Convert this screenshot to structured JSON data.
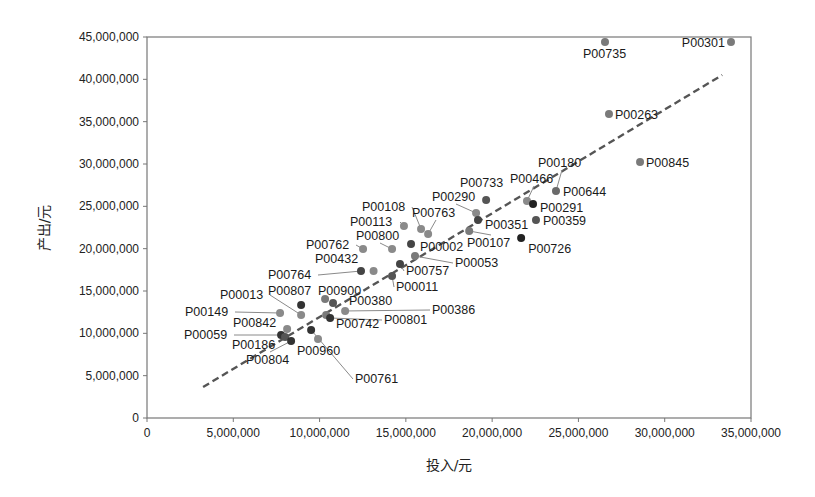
{
  "chart_data": {
    "type": "scatter",
    "title": "",
    "xlabel": "投入/元",
    "ylabel": "产出/元",
    "xlim": [
      0,
      35000000
    ],
    "ylim": [
      0,
      45000000
    ],
    "x_ticks": [
      0,
      5000000,
      10000000,
      15000000,
      20000000,
      25000000,
      30000000,
      35000000
    ],
    "x_tick_labels": [
      "0",
      "5,000,000",
      "10,000,000",
      "15,000,000",
      "20,000,000",
      "25,000,000",
      "30,000,000",
      "35,000,000"
    ],
    "y_ticks": [
      0,
      5000000,
      10000000,
      15000000,
      20000000,
      25000000,
      30000000,
      35000000,
      40000000,
      45000000
    ],
    "y_tick_labels": [
      "0",
      "5,000,000",
      "10,000,000",
      "15,000,000",
      "20,000,000",
      "25,000,000",
      "30,000,000",
      "35,000,000",
      "40,000,000",
      "45,000,000"
    ],
    "grid": false,
    "legend": false,
    "trendline": {
      "style": "dashed",
      "color": "#555555",
      "start": [
        3250000,
        3660000
      ],
      "end": [
        33330000,
        40510000
      ]
    },
    "points": [
      {
        "id": "P00735",
        "x": 26540000,
        "y": 44410000,
        "color": "#7a7a7a",
        "label_dx": -22,
        "label_dy": 16,
        "anchor": "start"
      },
      {
        "id": "P00301",
        "x": 33840000,
        "y": 44410000,
        "color": "#7a7a7a",
        "label_dx": -6,
        "label_dy": 5,
        "anchor": "end"
      },
      {
        "id": "P00263",
        "x": 26770000,
        "y": 35910000,
        "color": "#7a7a7a",
        "label_dx": 6,
        "label_dy": 5,
        "anchor": "start"
      },
      {
        "id": "P00845",
        "x": 28570000,
        "y": 30240000,
        "color": "#7a7a7a",
        "label_dx": 6,
        "label_dy": 5,
        "anchor": "start"
      },
      {
        "id": "P00180",
        "x": 23700000,
        "y": 26810000,
        "color": "#6a6a6a",
        "label_x": 538,
        "label_y": 167,
        "leader": true
      },
      {
        "id": "P00644",
        "x": 23700000,
        "y": 26810000,
        "color": "#6a6a6a",
        "label_dx": 7,
        "label_dy": 5,
        "anchor": "start",
        "hidden_point": true
      },
      {
        "id": "P00466",
        "x": 22020000,
        "y": 25630000,
        "color": "#8a8a8a",
        "label_x": 510,
        "label_y": 183,
        "leader": true
      },
      {
        "id": "P00291",
        "x": 22370000,
        "y": 25280000,
        "color": "#222222",
        "label_dx": 7,
        "label_dy": 8,
        "anchor": "start"
      },
      {
        "id": "P00733",
        "x": 19650000,
        "y": 25750000,
        "color": "#555555",
        "label_x": 460,
        "label_y": 187,
        "leader": false
      },
      {
        "id": "P00359",
        "x": 22540000,
        "y": 23390000,
        "color": "#555555",
        "label_dx": 7,
        "label_dy": 5,
        "anchor": "start"
      },
      {
        "id": "P00290",
        "x": 19070000,
        "y": 24210000,
        "color": "#8a8a8a",
        "label_x": 432,
        "label_y": 201,
        "leader": true
      },
      {
        "id": "P00351",
        "x": 19180000,
        "y": 23390000,
        "color": "#444444",
        "label_dx": 7,
        "label_dy": 9,
        "anchor": "start"
      },
      {
        "id": "P00726",
        "x": 21680000,
        "y": 21260000,
        "color": "#222222",
        "label_dx": 7,
        "label_dy": 15,
        "anchor": "start"
      },
      {
        "id": "P00107",
        "x": 18670000,
        "y": 22090000,
        "color": "#7a7a7a",
        "label_x": 467,
        "label_y": 247,
        "leader": true
      },
      {
        "id": "P00108",
        "x": 15880000,
        "y": 22320000,
        "color": "#8a8a8a",
        "label_x": 362,
        "label_y": 211,
        "leader": true
      },
      {
        "id": "P00763",
        "x": 16290000,
        "y": 21730000,
        "color": "#8a8a8a",
        "label_x": 412,
        "label_y": 217,
        "leader": true
      },
      {
        "id": "P00113",
        "x": 14890000,
        "y": 22680000,
        "color": "#8a8a8a",
        "label_x": 350,
        "label_y": 226,
        "leader": true
      },
      {
        "id": "P00800",
        "x": 14200000,
        "y": 19960000,
        "color": "#8a8a8a",
        "label_x": 356,
        "label_y": 240,
        "leader": true
      },
      {
        "id": "P00762",
        "x": 12520000,
        "y": 19960000,
        "color": "#8a8a8a",
        "label_x": 306,
        "label_y": 249,
        "leader": true
      },
      {
        "id": "P00002",
        "x": 15300000,
        "y": 20550000,
        "color": "#444444",
        "label_x": 420,
        "label_y": 251,
        "leader": false
      },
      {
        "id": "P00053",
        "x": 15530000,
        "y": 19130000,
        "color": "#7a7a7a",
        "label_x": 455,
        "label_y": 267,
        "leader": true
      },
      {
        "id": "P00757",
        "x": 14660000,
        "y": 18190000,
        "color": "#444444",
        "label_x": 406,
        "label_y": 275,
        "leader": true
      },
      {
        "id": "P00432",
        "x": 13130000,
        "y": 17360000,
        "color": "#8a8a8a",
        "label_x": 315,
        "label_y": 263,
        "leader": false
      },
      {
        "id": "P00764",
        "x": 12400000,
        "y": 17360000,
        "color": "#444444",
        "label_x": 268,
        "label_y": 279,
        "leader": true
      },
      {
        "id": "P00011",
        "x": 14200000,
        "y": 16770000,
        "color": "#555555",
        "label_x": 396,
        "label_y": 291,
        "leader": true
      },
      {
        "id": "P00900",
        "x": 10320000,
        "y": 14050000,
        "color": "#7a7a7a",
        "label_x": 318,
        "label_y": 295,
        "leader": false
      },
      {
        "id": "P00807",
        "x": 8930000,
        "y": 13350000,
        "color": "#333333",
        "label_x": 268,
        "label_y": 295,
        "leader": false
      },
      {
        "id": "P00013",
        "x": 8930000,
        "y": 12170000,
        "color": "#8a8a8a",
        "label_x": 220,
        "label_y": 299,
        "leader": true
      },
      {
        "id": "P00380",
        "x": 10780000,
        "y": 13580000,
        "color": "#555555",
        "label_x": 349,
        "label_y": 305,
        "leader": false
      },
      {
        "id": "P00386",
        "x": 11480000,
        "y": 12640000,
        "color": "#8a8a8a",
        "label_x": 432,
        "label_y": 314,
        "leader": true
      },
      {
        "id": "P00149",
        "x": 7710000,
        "y": 12400000,
        "color": "#8a8a8a",
        "label_x": 185,
        "label_y": 316,
        "leader": true
      },
      {
        "id": "P00742",
        "x": 10380000,
        "y": 12170000,
        "color": "#7a7a7a",
        "label_x": 336,
        "label_y": 328,
        "leader": false
      },
      {
        "id": "P00801",
        "x": 10610000,
        "y": 11810000,
        "color": "#333333",
        "label_x": 384,
        "label_y": 324,
        "leader": true
      },
      {
        "id": "P00842",
        "x": 8120000,
        "y": 10520000,
        "color": "#8a8a8a",
        "label_x": 233,
        "label_y": 327,
        "leader": false
      },
      {
        "id": "P00761",
        "x": 9510000,
        "y": 10400000,
        "color": "#333333",
        "label_x": 355,
        "label_y": 383,
        "leader": true
      },
      {
        "id": "P00059",
        "x": 7770000,
        "y": 9800000,
        "color": "#333333",
        "label_x": 184,
        "label_y": 339,
        "leader": true
      },
      {
        "id": "P00186",
        "x": 8000000,
        "y": 9570000,
        "color": "#555555",
        "label_x": 232,
        "label_y": 349,
        "leader": false
      },
      {
        "id": "P00804",
        "x": 8350000,
        "y": 9090000,
        "color": "#333333",
        "label_x": 246,
        "label_y": 364,
        "leader": true
      },
      {
        "id": "P00960",
        "x": 9910000,
        "y": 9330000,
        "color": "#8a8a8a",
        "label_x": 297,
        "label_y": 355,
        "leader": false
      }
    ]
  }
}
